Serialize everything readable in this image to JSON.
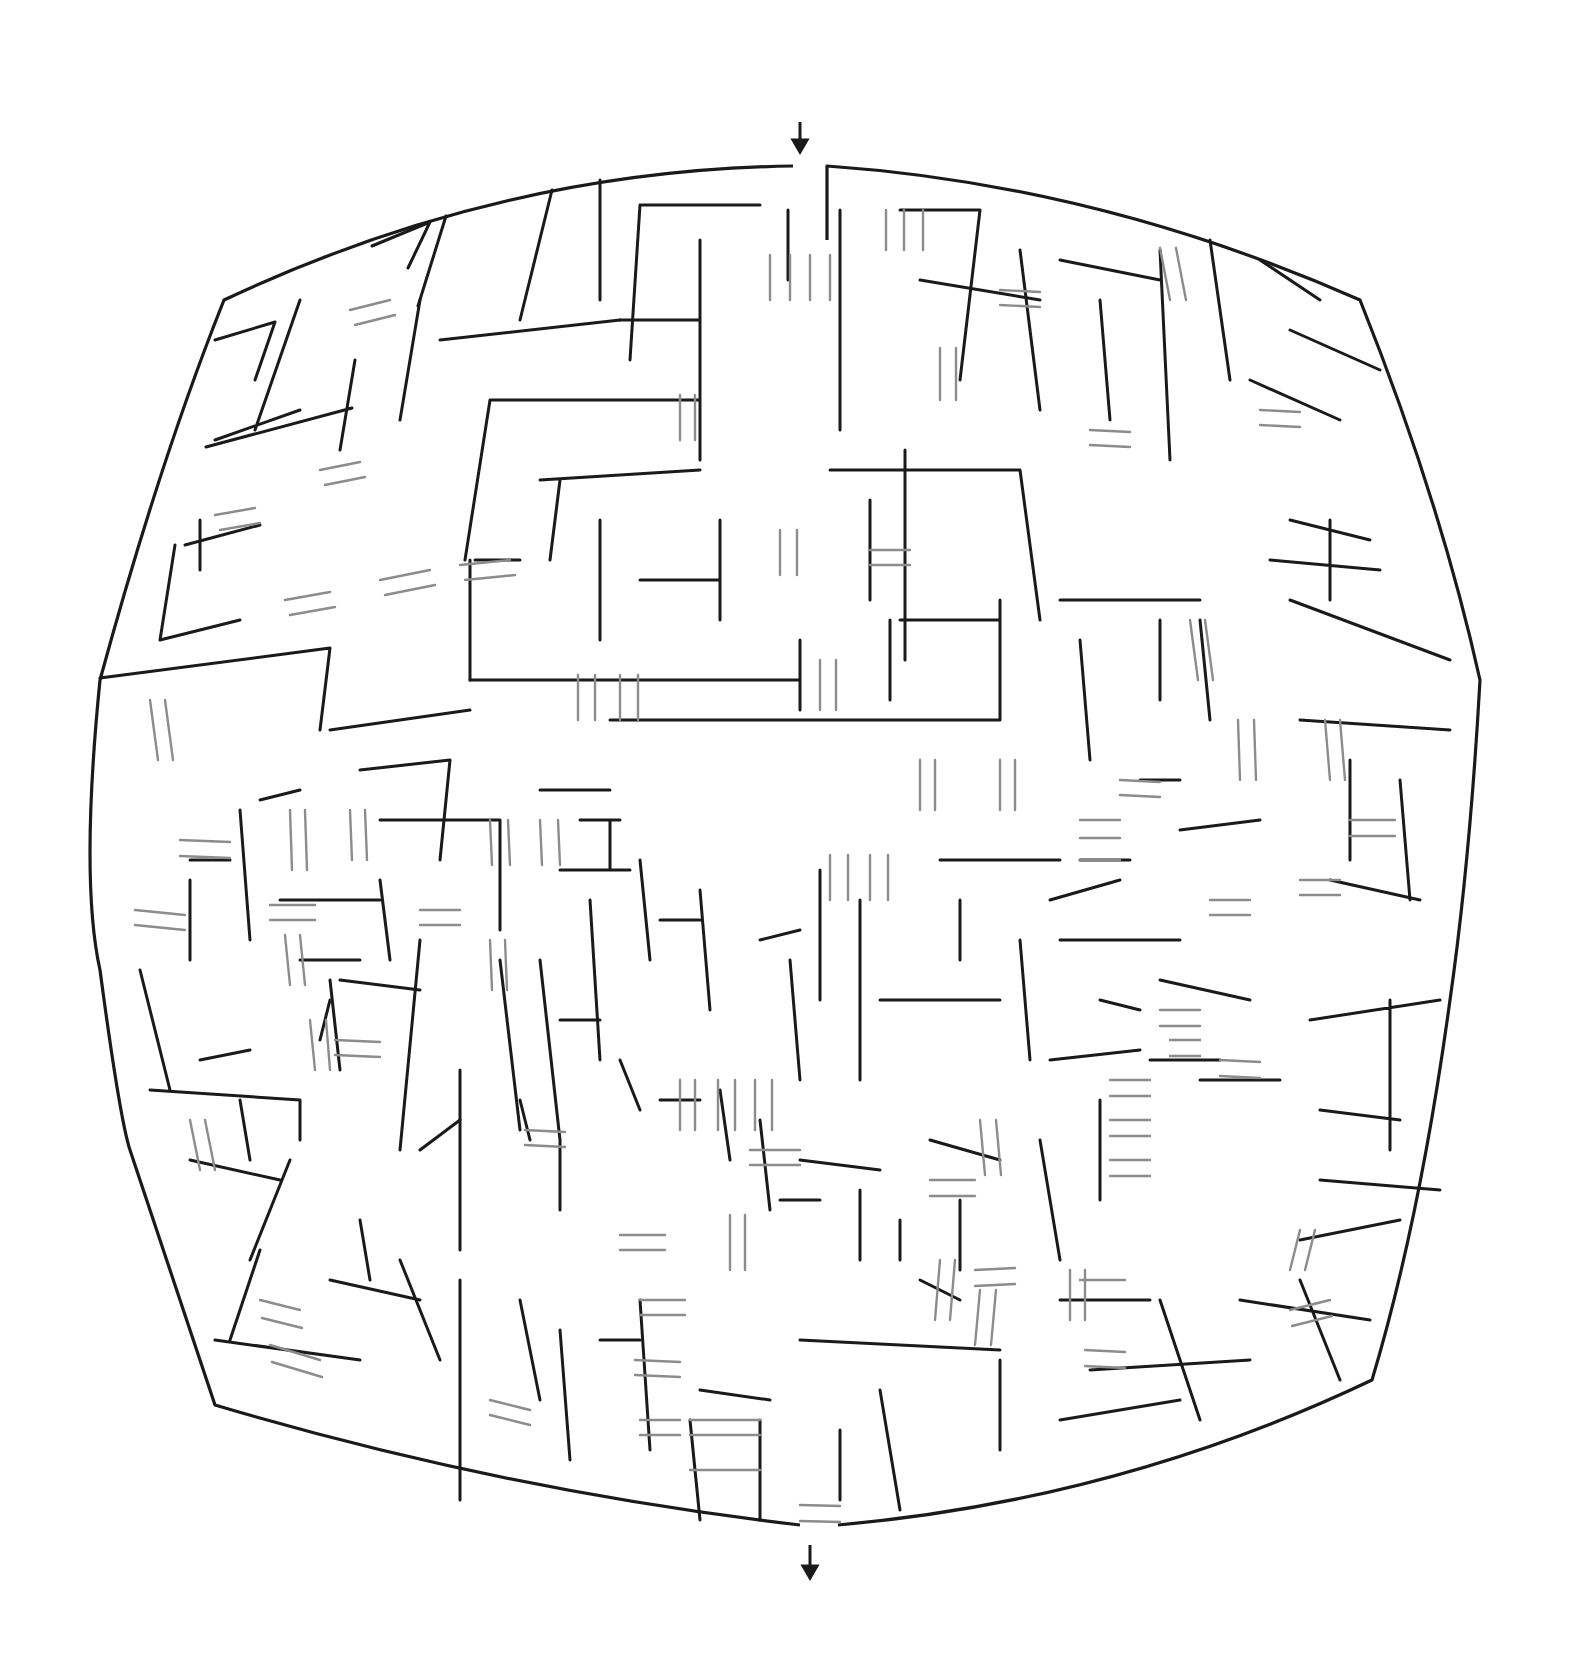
{
  "puzzle": {
    "type": "maze",
    "style": "bulged square maze with bridges (over/under passages)",
    "colors": {
      "background": "#ffffff",
      "wall": "#1a1a1a",
      "bridge": "#8c8c8c"
    },
    "entrance": {
      "label": "entrance-arrow",
      "direction": "down",
      "x": 800,
      "y": 122
    },
    "exit": {
      "label": "exit-arrow",
      "direction": "down",
      "x": 810,
      "y": 1545
    },
    "outline": {
      "top_left": [
        224,
        300
      ],
      "top_right": [
        1360,
        300
      ],
      "bottom_left": [
        215,
        1405
      ],
      "bottom_right": [
        1372,
        1380
      ],
      "entrance_gap": [
        793,
        827
      ],
      "exit_gap": [
        800,
        838
      ]
    },
    "walls": [
      "M372 246 L430 222 M430 222 L408 268 M446 216 L418 306 M552 190 L520 320",
      "M600 180 L600 300 M640 205 L630 360 M640 205 L760 205 M788 210 L788 280",
      "M215 340 L275 322 M275 322 L255 380 M300 300 L255 430 M215 440 L300 410",
      "M206 447 L352 408 M355 360 L340 450 M420 300 L400 420 M440 340 L620 320",
      "M620 320 L700 320 M700 240 L700 460 M490 400 L700 400 M490 400 L465 560",
      "M540 480 L700 470 M560 480 L550 560 M600 520 L600 640 M475 560 L520 560",
      "M185 545 L260 525 M175 545 L160 640 M160 640 L240 620 M200 520 L200 570",
      "M100 678 L330 648 M330 648 L320 730 M330 730 L470 710 M470 560 L470 680",
      "M470 680 L800 680 M800 640 L800 710 M640 580 L720 580 M720 520 L720 620",
      "M610 720 L1000 720 M1000 720 L1000 600 M900 620 L1000 620 M890 620 L890 700",
      "M905 450 L905 660 M830 470 L1020 470 M1020 470 L1040 620 M870 500 L870 600",
      "M840 210 L840 430 M900 210 L980 210 M980 210 L960 380 M920 280 L1040 300",
      "M1020 250 L1040 410 M1060 260 L1160 280 M1100 300 L1110 420 M1160 250 L1170 460",
      "M1210 240 L1230 380 M1260 260 L1320 300 M1290 330 L1380 370 M1250 380 L1340 420",
      "M1370 540 L1290 520 M1330 520 L1330 600 M1270 560 L1380 570 M1290 600 L1450 660",
      "M1200 620 L1210 720 M1060 600 L1200 600 M1160 620 L1160 700 M1080 640 L1090 760",
      "M1300 720 L1450 730 M1350 760 L1350 860 M1400 780 L1410 900 M1330 880 L1420 900",
      "M1180 830 L1260 820 M1140 780 L1180 780 M1080 860 L1130 860 M1050 900 L1120 880",
      "M1060 940 L1180 940 M1160 980 L1250 1000 M1150 1060 L1220 1060 M1200 1080 L1280 1080",
      "M1310 1020 L1440 1000 M1390 1000 L1390 1150 M1320 1110 L1400 1120 M1320 1180 L1440 1190",
      "M1300 1240 L1400 1220 M1300 1280 L1340 1380 M1240 1300 L1370 1320 M1160 1300 L1200 1420",
      "M1060 1420 L1180 1400 M1090 1370 L1250 1360 M1000 1360 L1000 1450 M1060 1300 L1150 1300",
      "M920 1280 L960 1300 M800 1340 L1000 1350 M880 1390 L900 1510 M840 1430 L840 1500",
      "M700 1390 L770 1400 M760 1420 L760 1520 M690 1420 L700 1520 M640 1300 L650 1450",
      "M600 1340 L640 1340 M560 1330 L570 1460 M520 1300 L540 1400 M460 1280 L460 1500",
      "M400 1260 L440 1360 M330 1280 L420 1300 M360 1220 L370 1280 M260 1250 L230 1340",
      "M215 1340 L360 1360 M290 1160 L250 1260 M190 1160 L280 1180 M200 1060 L250 1050",
      "M140 970 L170 1090 M150 1090 L300 1100 M240 1100 L250 1160 M300 1100 L300 1140",
      "M330 980 L340 1070 M340 980 L420 990 M420 940 L400 1150 M420 1150 L460 1120",
      "M460 1070 L460 1250 M500 960 L520 1130 M540 960 L560 1140 M560 1140 L560 1210",
      "M590 900 L600 1060 M640 860 L650 960 M660 920 L700 920 M700 890 L710 1010",
      "M760 940 L800 930 M790 960 L800 1080 M820 870 L820 1000 M860 900 L860 1080",
      "M880 1000 L1000 1000 M960 900 L960 960 M940 860 L1060 860 M1020 940 L1030 1060",
      "M1100 1000 L1140 1010 M1050 1060 L1140 1050 M1100 1100 L1100 1200 M1040 1140 L1060 1260",
      "M930 1140 L1000 1160 M960 1200 L960 1270 M900 1220 L900 1260 M860 1190 L860 1260",
      "M800 1160 L880 1170 M780 1200 L820 1200 M760 1120 L770 1210 M720 1090 L730 1160",
      "M660 1100 L700 1100 M620 1060 L640 1110 M560 1020 L600 1020 M520 1100 L530 1140",
      "M360 770 L450 760 M450 760 L440 860 M380 820 L500 820 M500 820 L500 930",
      "M540 790 L610 790 M580 820 L620 820 M610 820 L610 870 M560 870 L630 870",
      "M260 800 L300 790 M240 810 L250 940 M190 860 L230 860 M190 880 L190 960",
      "M280 900 L380 900 M380 880 L390 960 M300 960 L360 960 M330 1000 L320 1040"
    ],
    "bridges": [
      [
        770,
        255,
        770,
        300
      ],
      [
        790,
        255,
        790,
        300
      ],
      [
        810,
        255,
        810,
        300
      ],
      [
        830,
        255,
        830,
        300
      ],
      [
        886,
        210,
        886,
        250
      ],
      [
        904,
        210,
        904,
        250
      ],
      [
        923,
        210,
        923,
        250
      ],
      [
        680,
        395,
        680,
        440
      ],
      [
        695,
        395,
        695,
        440
      ],
      [
        940,
        348,
        940,
        400
      ],
      [
        956,
        348,
        956,
        400
      ],
      [
        1000,
        290,
        1040,
        292
      ],
      [
        1000,
        305,
        1040,
        307
      ],
      [
        1160,
        248,
        1170,
        300
      ],
      [
        1176,
        248,
        1186,
        300
      ],
      [
        1090,
        430,
        1130,
        432
      ],
      [
        1090,
        445,
        1130,
        447
      ],
      [
        1260,
        410,
        1300,
        412
      ],
      [
        1260,
        425,
        1300,
        427
      ],
      [
        350,
        310,
        390,
        300
      ],
      [
        355,
        325,
        395,
        315
      ],
      [
        320,
        470,
        360,
        462
      ],
      [
        325,
        485,
        365,
        477
      ],
      [
        215,
        515,
        255,
        508
      ],
      [
        220,
        530,
        260,
        523
      ],
      [
        285,
        600,
        330,
        592
      ],
      [
        290,
        615,
        335,
        607
      ],
      [
        380,
        580,
        430,
        570
      ],
      [
        385,
        595,
        435,
        585
      ],
      [
        460,
        565,
        510,
        560
      ],
      [
        465,
        580,
        515,
        575
      ],
      [
        578,
        675,
        578,
        720
      ],
      [
        595,
        675,
        595,
        720
      ],
      [
        620,
        675,
        620,
        720
      ],
      [
        638,
        675,
        638,
        720
      ],
      [
        780,
        530,
        780,
        575
      ],
      [
        797,
        530,
        797,
        575
      ],
      [
        820,
        660,
        820,
        710
      ],
      [
        836,
        660,
        836,
        710
      ],
      [
        870,
        550,
        910,
        550
      ],
      [
        870,
        565,
        910,
        565
      ],
      [
        920,
        760,
        920,
        810
      ],
      [
        935,
        760,
        935,
        810
      ],
      [
        1000,
        760,
        1000,
        810
      ],
      [
        1015,
        760,
        1015,
        810
      ],
      [
        830,
        855,
        830,
        900
      ],
      [
        848,
        855,
        848,
        900
      ],
      [
        870,
        855,
        870,
        900
      ],
      [
        888,
        855,
        888,
        900
      ],
      [
        1080,
        820,
        1120,
        820
      ],
      [
        1080,
        838,
        1120,
        838
      ],
      [
        1080,
        860,
        1120,
        860
      ],
      [
        1120,
        780,
        1160,
        782
      ],
      [
        1120,
        795,
        1160,
        797
      ],
      [
        1190,
        620,
        1198,
        680
      ],
      [
        1205,
        620,
        1213,
        680
      ],
      [
        1238,
        720,
        1240,
        780
      ],
      [
        1254,
        720,
        1256,
        780
      ],
      [
        1325,
        720,
        1330,
        780
      ],
      [
        1340,
        720,
        1345,
        780
      ],
      [
        1350,
        820,
        1395,
        820
      ],
      [
        1350,
        836,
        1395,
        836
      ],
      [
        1300,
        880,
        1340,
        880
      ],
      [
        1300,
        895,
        1340,
        895
      ],
      [
        1210,
        900,
        1250,
        900
      ],
      [
        1210,
        915,
        1250,
        915
      ],
      [
        150,
        700,
        158,
        760
      ],
      [
        165,
        700,
        173,
        760
      ],
      [
        180,
        840,
        230,
        842
      ],
      [
        180,
        856,
        230,
        858
      ],
      [
        135,
        910,
        185,
        915
      ],
      [
        135,
        925,
        185,
        930
      ],
      [
        290,
        810,
        292,
        870
      ],
      [
        305,
        810,
        307,
        870
      ],
      [
        270,
        905,
        315,
        905
      ],
      [
        270,
        920,
        315,
        920
      ],
      [
        285,
        935,
        290,
        985
      ],
      [
        300,
        935,
        305,
        985
      ],
      [
        350,
        810,
        352,
        860
      ],
      [
        365,
        810,
        367,
        860
      ],
      [
        490,
        820,
        492,
        865
      ],
      [
        508,
        820,
        510,
        865
      ],
      [
        540,
        820,
        542,
        865
      ],
      [
        558,
        820,
        560,
        865
      ],
      [
        420,
        910,
        460,
        910
      ],
      [
        420,
        925,
        460,
        925
      ],
      [
        490,
        940,
        492,
        990
      ],
      [
        505,
        940,
        507,
        990
      ],
      [
        310,
        1020,
        315,
        1070
      ],
      [
        326,
        1020,
        330,
        1070
      ],
      [
        335,
        1040,
        380,
        1042
      ],
      [
        335,
        1055,
        380,
        1057
      ],
      [
        190,
        1120,
        200,
        1170
      ],
      [
        205,
        1120,
        215,
        1170
      ],
      [
        260,
        1300,
        300,
        1310
      ],
      [
        262,
        1318,
        302,
        1328
      ],
      [
        270,
        1345,
        320,
        1360
      ],
      [
        272,
        1362,
        322,
        1377
      ],
      [
        525,
        1130,
        565,
        1132
      ],
      [
        525,
        1145,
        565,
        1147
      ],
      [
        680,
        1080,
        680,
        1130
      ],
      [
        695,
        1080,
        695,
        1130
      ],
      [
        718,
        1080,
        718,
        1130
      ],
      [
        735,
        1080,
        735,
        1130
      ],
      [
        755,
        1080,
        755,
        1130
      ],
      [
        772,
        1080,
        772,
        1130
      ],
      [
        750,
        1150,
        800,
        1150
      ],
      [
        750,
        1165,
        800,
        1165
      ],
      [
        620,
        1235,
        665,
        1235
      ],
      [
        620,
        1250,
        665,
        1250
      ],
      [
        730,
        1215,
        730,
        1270
      ],
      [
        745,
        1215,
        745,
        1270
      ],
      [
        640,
        1300,
        685,
        1300
      ],
      [
        640,
        1315,
        685,
        1315
      ],
      [
        635,
        1360,
        680,
        1362
      ],
      [
        635,
        1375,
        680,
        1377
      ],
      [
        490,
        1400,
        530,
        1410
      ],
      [
        490,
        1415,
        530,
        1425
      ],
      [
        640,
        1420,
        680,
        1420
      ],
      [
        640,
        1435,
        680,
        1435
      ],
      [
        690,
        1420,
        760,
        1420
      ],
      [
        690,
        1435,
        760,
        1435
      ],
      [
        690,
        1470,
        760,
        1470
      ],
      [
        800,
        1505,
        840,
        1506
      ],
      [
        800,
        1521,
        840,
        1522
      ],
      [
        980,
        1120,
        985,
        1175
      ],
      [
        996,
        1120,
        1001,
        1175
      ],
      [
        930,
        1180,
        975,
        1180
      ],
      [
        930,
        1196,
        975,
        1196
      ],
      [
        940,
        1260,
        935,
        1320
      ],
      [
        955,
        1260,
        950,
        1320
      ],
      [
        975,
        1270,
        1015,
        1268
      ],
      [
        975,
        1286,
        1015,
        1284
      ],
      [
        980,
        1290,
        975,
        1345
      ],
      [
        996,
        1290,
        991,
        1345
      ],
      [
        1070,
        1270,
        1070,
        1320
      ],
      [
        1085,
        1270,
        1085,
        1320
      ],
      [
        1110,
        1080,
        1150,
        1080
      ],
      [
        1110,
        1096,
        1150,
        1096
      ],
      [
        1110,
        1120,
        1150,
        1120
      ],
      [
        1110,
        1136,
        1150,
        1136
      ],
      [
        1110,
        1160,
        1150,
        1160
      ],
      [
        1110,
        1176,
        1150,
        1176
      ],
      [
        1160,
        1010,
        1200,
        1010
      ],
      [
        1160,
        1026,
        1200,
        1026
      ],
      [
        1170,
        1040,
        1200,
        1040
      ],
      [
        1170,
        1056,
        1200,
        1056
      ],
      [
        1220,
        1060,
        1260,
        1062
      ],
      [
        1220,
        1076,
        1260,
        1078
      ],
      [
        1085,
        1350,
        1125,
        1352
      ],
      [
        1085,
        1366,
        1125,
        1368
      ],
      [
        1080,
        1280,
        1125,
        1280
      ],
      [
        1290,
        1310,
        1330,
        1300
      ],
      [
        1292,
        1326,
        1332,
        1316
      ],
      [
        1290,
        1270,
        1300,
        1230
      ],
      [
        1305,
        1270,
        1315,
        1230
      ]
    ]
  }
}
